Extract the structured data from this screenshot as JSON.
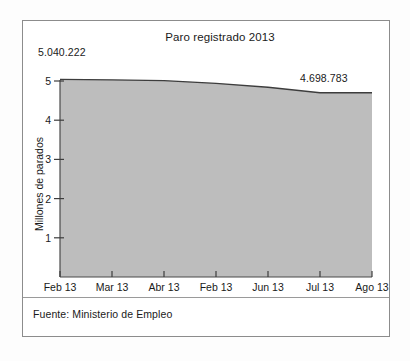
{
  "figure": {
    "source_note": "Fuente: Ministerio de Empleo",
    "frame_color": "#8c8c8c",
    "background": "#ffffff"
  },
  "annotations": {
    "start_value": "5.040.222",
    "end_value": "4.698.783"
  },
  "chart_data": {
    "type": "area",
    "title": "Paro registrado 2013",
    "xlabel": "",
    "ylabel": "Millones de parados",
    "categories": [
      "Feb 13",
      "Mar 13",
      "Abr 13",
      "Feb 13",
      "Jun 13",
      "Jul 13",
      "Ago 13"
    ],
    "values": [
      5.04,
      5.03,
      5.01,
      4.94,
      4.84,
      4.7,
      4.7
    ],
    "ylim": [
      0,
      5.3
    ],
    "yticks": [
      1,
      2,
      3,
      4,
      5
    ],
    "ytick_labels": [
      "1",
      "2",
      "3",
      "4",
      "5"
    ],
    "grid": false,
    "legend": "none",
    "series": [
      {
        "name": "Paro registrado",
        "values": [
          5.04,
          5.03,
          5.01,
          4.94,
          4.84,
          4.7,
          4.7
        ],
        "fill_color": "#bdbdbd",
        "line_color": "#3d3d3d"
      }
    ],
    "units": "millones de parados",
    "first_point_label": "5.040.222",
    "last_point_label": "4.698.783"
  }
}
